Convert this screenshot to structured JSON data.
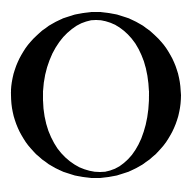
{
  "glyph": {
    "character": "O",
    "style": "serif capital letter",
    "color": "#000000",
    "background": "#ffffff"
  }
}
